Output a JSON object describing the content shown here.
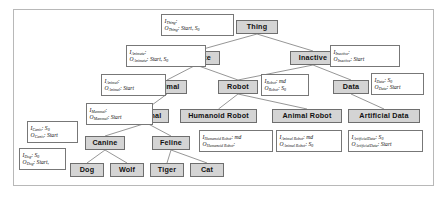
{
  "diagram": {
    "frame": {
      "border_color": "#b8b8b8",
      "background": "#ffffff"
    },
    "node_style": {
      "fill": "#d4d4d4",
      "border": "#6e6e6e",
      "text": "#111111"
    },
    "annotation_style": {
      "fill": "#ffffff",
      "border": "#777777",
      "text": "#111111"
    },
    "edge_color": "#8a8a8a"
  },
  "nodes": [
    {
      "id": "thing",
      "label": "Thing",
      "x": 236,
      "y": 20,
      "w": 42,
      "h": 14
    },
    {
      "id": "animate",
      "label": "Animate",
      "x": 172,
      "y": 51,
      "w": 48,
      "h": 14
    },
    {
      "id": "inactive",
      "label": "Inactive",
      "x": 290,
      "y": 51,
      "w": 46,
      "h": 14
    },
    {
      "id": "animal",
      "label": "Animal",
      "x": 147,
      "y": 80,
      "w": 40,
      "h": 14
    },
    {
      "id": "robot",
      "label": "Robot",
      "x": 218,
      "y": 80,
      "w": 40,
      "h": 14
    },
    {
      "id": "data",
      "label": "Data",
      "x": 333,
      "y": 80,
      "w": 36,
      "h": 14
    },
    {
      "id": "mammal",
      "label": "Mammal",
      "x": 124,
      "y": 109,
      "w": 45,
      "h": 14
    },
    {
      "id": "humanoid-robot",
      "label": "Humanoid Robot",
      "x": 180,
      "y": 109,
      "w": 77,
      "h": 14
    },
    {
      "id": "animal-robot",
      "label": "Animal Robot",
      "x": 272,
      "y": 109,
      "w": 70,
      "h": 14
    },
    {
      "id": "artificial-data",
      "label": "Artificial Data",
      "x": 348,
      "y": 109,
      "w": 72,
      "h": 14
    },
    {
      "id": "canine",
      "label": "Canine",
      "x": 85,
      "y": 136,
      "w": 40,
      "h": 14
    },
    {
      "id": "feline",
      "label": "Feline",
      "x": 152,
      "y": 136,
      "w": 38,
      "h": 14
    },
    {
      "id": "dog",
      "label": "Dog",
      "x": 70,
      "y": 163,
      "w": 34,
      "h": 14
    },
    {
      "id": "wolf",
      "label": "Wolf",
      "x": 110,
      "y": 163,
      "w": 34,
      "h": 14
    },
    {
      "id": "tiger",
      "label": "Tiger",
      "x": 150,
      "y": 163,
      "w": 34,
      "h": 14
    },
    {
      "id": "cat",
      "label": "Cat",
      "x": 190,
      "y": 163,
      "w": 34,
      "h": 14
    }
  ],
  "edges": [
    {
      "from": "thing",
      "to": "animate"
    },
    {
      "from": "thing",
      "to": "inactive"
    },
    {
      "from": "animate",
      "to": "animal"
    },
    {
      "from": "animate",
      "to": "robot"
    },
    {
      "from": "inactive",
      "to": "robot"
    },
    {
      "from": "inactive",
      "to": "data"
    },
    {
      "from": "animal",
      "to": "mammal"
    },
    {
      "from": "robot",
      "to": "humanoid-robot"
    },
    {
      "from": "robot",
      "to": "animal-robot"
    },
    {
      "from": "data",
      "to": "artificial-data"
    },
    {
      "from": "mammal",
      "to": "canine"
    },
    {
      "from": "mammal",
      "to": "feline"
    },
    {
      "from": "canine",
      "to": "dog"
    },
    {
      "from": "canine",
      "to": "wolf"
    },
    {
      "from": "feline",
      "to": "tiger"
    },
    {
      "from": "feline",
      "to": "cat"
    }
  ],
  "annotations": [
    {
      "id": "ann-thing",
      "for": "thing",
      "input_symbol": "I",
      "input_sub": "Thing",
      "input_value": "",
      "output_symbol": "O",
      "output_sub": "Thing",
      "output_value": "Start, S",
      "output_value_sub": "0",
      "x": 161,
      "y": 14,
      "w": 73,
      "h": 22
    },
    {
      "id": "ann-animate",
      "for": "animate",
      "input_symbol": "I",
      "input_sub": "Animate",
      "input_value": "",
      "output_symbol": "O",
      "output_sub": "Animate",
      "output_value": "Start, S",
      "output_value_sub": "0",
      "x": 126,
      "y": 45,
      "w": 80,
      "h": 22
    },
    {
      "id": "ann-inactive",
      "for": "inactive",
      "input_symbol": "I",
      "input_sub": "Inactive",
      "input_value": "",
      "output_symbol": "O",
      "output_sub": "Inactive",
      "output_value": "Start",
      "output_value_sub": "",
      "x": 330,
      "y": 45,
      "w": 70,
      "h": 22
    },
    {
      "id": "ann-animal",
      "for": "animal",
      "input_symbol": "I",
      "input_sub": "Animal",
      "input_value": "",
      "output_symbol": "O",
      "output_sub": "Animal",
      "output_value": "Start",
      "output_value_sub": "",
      "x": 101,
      "y": 74,
      "w": 65,
      "h": 22
    },
    {
      "id": "ann-robot",
      "for": "robot",
      "input_symbol": "I",
      "input_sub": "Robot",
      "input_value": "md",
      "output_symbol": "O",
      "output_sub": "Robot",
      "output_value": "S",
      "output_value_sub": "0",
      "x": 261,
      "y": 74,
      "w": 48,
      "h": 22
    },
    {
      "id": "ann-data",
      "for": "data",
      "input_symbol": "I",
      "input_sub": "Data",
      "input_value": "S",
      "input_value_sub": "0",
      "output_symbol": "O",
      "output_sub": "Data",
      "output_value": "Start",
      "output_value_sub": "",
      "x": 371,
      "y": 73,
      "w": 53,
      "h": 22
    },
    {
      "id": "ann-mammal",
      "for": "mammal",
      "input_symbol": "I",
      "input_sub": "Mammal",
      "input_value": "",
      "output_symbol": "O",
      "output_sub": "Mammal",
      "output_value": "Start",
      "output_value_sub": "",
      "x": 86,
      "y": 103,
      "w": 67,
      "h": 22
    },
    {
      "id": "ann-canine",
      "for": "canine",
      "input_symbol": "I",
      "input_sub": "Canis",
      "input_value": "S",
      "input_value_sub": "0",
      "output_symbol": "O",
      "output_sub": "Canis",
      "output_value": "Start",
      "output_value_sub": "",
      "x": 27,
      "y": 121,
      "w": 51,
      "h": 22
    },
    {
      "id": "ann-dog",
      "for": "dog",
      "input_symbol": "I",
      "input_sub": "Dog",
      "input_value": "S",
      "input_value_sub": "0",
      "output_symbol": "O",
      "output_sub": "Dog",
      "output_value": "Start,",
      "output_value_sub": "",
      "x": 19,
      "y": 148,
      "w": 47,
      "h": 22
    },
    {
      "id": "ann-humanoid-robot",
      "for": "humanoid-robot",
      "input_symbol": "I",
      "input_sub": "Humanoid Robot",
      "input_value": "md",
      "output_symbol": "O",
      "output_sub": "Humanoid Robot",
      "output_value": "",
      "output_value_sub": "",
      "x": 199,
      "y": 130,
      "w": 74,
      "h": 22
    },
    {
      "id": "ann-animal-robot",
      "for": "animal-robot",
      "input_symbol": "I",
      "input_sub": "Animal Robot",
      "input_value": "md",
      "output_symbol": "O",
      "output_sub": "Animal Robot",
      "output_value": "S",
      "output_value_sub": "0",
      "x": 276,
      "y": 130,
      "w": 66,
      "h": 22
    },
    {
      "id": "ann-artificial-data",
      "for": "artificial-data",
      "input_symbol": "I",
      "input_sub": "ArtificialData",
      "input_value": "S",
      "input_value_sub": "0",
      "output_symbol": "O",
      "output_sub": "ArtificialData",
      "output_value": "Start",
      "output_value_sub": "",
      "x": 348,
      "y": 130,
      "w": 75,
      "h": 22
    }
  ]
}
